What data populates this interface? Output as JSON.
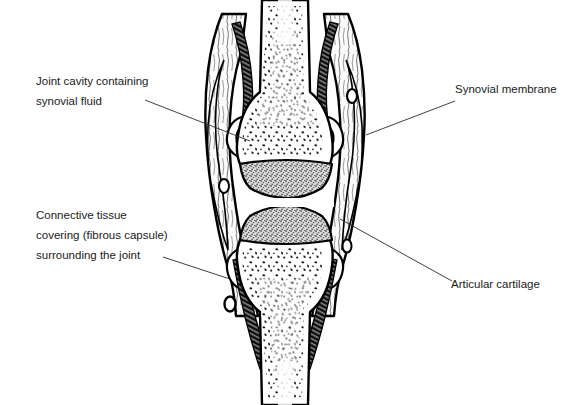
{
  "figure": {
    "background_color": "#ffffff",
    "ink_color": "#000000",
    "cartilage_color": "#9a9a9a",
    "membrane_color": "#1a1a1a",
    "capsule_fill": "#fbfbfb"
  },
  "labels": {
    "joint_cavity": {
      "line1": "Joint cavity containing",
      "line2": "synovial fluid"
    },
    "synovial_membrane": {
      "line1": "Synovial  membrane"
    },
    "connective_tissue": {
      "line1": "Connective tissue",
      "line2": "covering (fibrous capsule)",
      "line3": "surrounding the joint"
    },
    "articular_cartilage": {
      "line1": "Articular cartilage"
    }
  },
  "structures": {
    "upper_bone": "upper bone shaft with trabecular marrow",
    "lower_bone": "lower bone shaft with trabecular marrow",
    "upper_cartilage": "upper articular cartilage cap",
    "lower_cartilage": "lower articular cartilage cap",
    "joint_cavity": "joint cavity space",
    "fibrous_capsule_left": "left fibrous capsule wall",
    "fibrous_capsule_right": "right fibrous capsule wall",
    "synovial_membrane_left": "left synovial membrane band",
    "synovial_membrane_right": "right synovial membrane band"
  }
}
